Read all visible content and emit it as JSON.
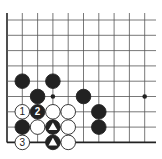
{
  "diagram": {
    "type": "go-board-corner",
    "grid": {
      "origin_x": 7,
      "origin_y": 20,
      "spacing": 15.3,
      "cols": 10,
      "rows": 9,
      "right_extent": 156,
      "top_extent": 13,
      "line_color": "#555555",
      "edge_color": "#222222"
    },
    "star_points": [
      {
        "col": 3,
        "row": 5
      },
      {
        "col": 9,
        "row": 5
      }
    ],
    "stones": [
      {
        "col": 1,
        "row": 4,
        "color": "black",
        "label": ""
      },
      {
        "col": 3,
        "row": 4,
        "color": "black",
        "label": ""
      },
      {
        "col": 2,
        "row": 5,
        "color": "black",
        "label": ""
      },
      {
        "col": 5,
        "row": 5,
        "color": "black",
        "label": ""
      },
      {
        "col": 1,
        "row": 6,
        "color": "white",
        "label": "1"
      },
      {
        "col": 2,
        "row": 6,
        "color": "black",
        "label": "2"
      },
      {
        "col": 3,
        "row": 6,
        "color": "white",
        "label": ""
      },
      {
        "col": 4,
        "row": 6,
        "color": "white",
        "label": ""
      },
      {
        "col": 6,
        "row": 6,
        "color": "black",
        "label": ""
      },
      {
        "col": 1,
        "row": 7,
        "color": "black",
        "label": ""
      },
      {
        "col": 2,
        "row": 7,
        "color": "white",
        "label": ""
      },
      {
        "col": 3,
        "row": 7,
        "color": "black",
        "label": "",
        "marker": "triangle"
      },
      {
        "col": 4,
        "row": 7,
        "color": "white",
        "label": ""
      },
      {
        "col": 6,
        "row": 7,
        "color": "black",
        "label": ""
      },
      {
        "col": 1,
        "row": 8,
        "color": "white",
        "label": "3"
      },
      {
        "col": 3,
        "row": 8,
        "color": "black",
        "label": "",
        "marker": "triangle"
      },
      {
        "col": 4,
        "row": 8,
        "color": "white",
        "label": ""
      }
    ]
  }
}
